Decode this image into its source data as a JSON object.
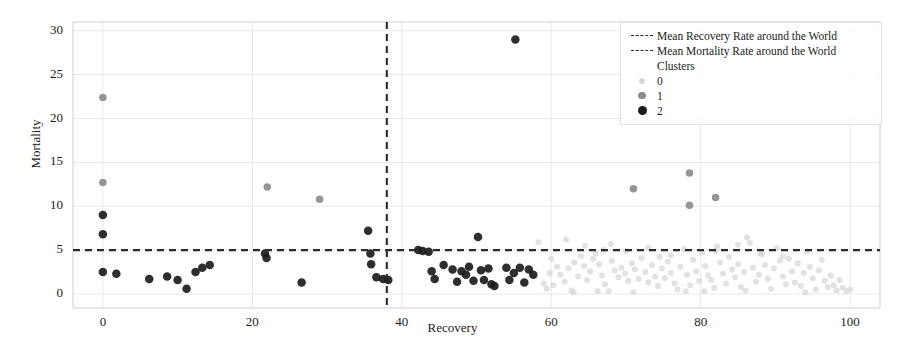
{
  "chart_data": {
    "type": "scatter",
    "title": "",
    "xlabel": "Recovery",
    "ylabel": "Mortality",
    "xlim": [
      -4,
      104
    ],
    "ylim": [
      -1.6,
      31
    ],
    "xticks": [
      0,
      20,
      40,
      60,
      80,
      100
    ],
    "yticks": [
      0,
      5,
      10,
      15,
      20,
      25,
      30
    ],
    "grid": true,
    "legend_position": "upper right",
    "reference_lines": [
      {
        "name": "Mean Recovery Rate around  the World",
        "orientation": "vertical",
        "value": 38.0,
        "style": "dashed",
        "color": "#2b2b2b"
      },
      {
        "name": "Mean Mortality Rate around  the World",
        "orientation": "horizontal",
        "value": 5.0,
        "style": "dashed",
        "color": "#2b2b2b"
      }
    ],
    "legend": {
      "line_entries": [
        "Mean Recovery Rate around  the World",
        "Mean Mortality Rate around  the World"
      ],
      "group_title": "Clusters",
      "cluster_entries": [
        "0",
        "1",
        "2"
      ]
    },
    "series": [
      {
        "name": "0",
        "cluster": 0,
        "color": "#d7d7d7",
        "marker_size": 6,
        "points": [
          [
            58.3,
            5.9
          ],
          [
            59.0,
            1.2
          ],
          [
            59.4,
            0.6
          ],
          [
            59.8,
            2.4
          ],
          [
            60.3,
            1.0
          ],
          [
            60.8,
            3.1
          ],
          [
            61.2,
            2.2
          ],
          [
            61.8,
            1.4
          ],
          [
            62.3,
            2.9
          ],
          [
            62.7,
            0.4
          ],
          [
            63.1,
            3.6
          ],
          [
            63.6,
            2.0
          ],
          [
            64.0,
            4.3
          ],
          [
            64.4,
            3.2
          ],
          [
            64.8,
            1.6
          ],
          [
            65.2,
            2.6
          ],
          [
            65.6,
            4.0
          ],
          [
            66.0,
            4.6
          ],
          [
            66.4,
            3.4
          ],
          [
            66.8,
            2.1
          ],
          [
            67.2,
            1.1
          ],
          [
            67.7,
            0.3
          ],
          [
            68.1,
            3.8
          ],
          [
            68.5,
            2.7
          ],
          [
            69.0,
            1.9
          ],
          [
            69.4,
            3.0
          ],
          [
            69.9,
            2.3
          ],
          [
            70.3,
            1.5
          ],
          [
            70.8,
            3.5
          ],
          [
            71.2,
            2.8
          ],
          [
            71.7,
            1.7
          ],
          [
            72.1,
            4.1
          ],
          [
            72.6,
            2.5
          ],
          [
            73.0,
            1.3
          ],
          [
            73.5,
            3.3
          ],
          [
            73.9,
            2.0
          ],
          [
            74.3,
            0.9
          ],
          [
            74.8,
            2.9
          ],
          [
            75.2,
            1.8
          ],
          [
            75.6,
            3.7
          ],
          [
            76.0,
            2.4
          ],
          [
            76.5,
            1.2
          ],
          [
            76.9,
            0.5
          ],
          [
            77.3,
            3.1
          ],
          [
            77.8,
            5.1
          ],
          [
            78.2,
            2.2
          ],
          [
            78.6,
            1.0
          ],
          [
            79.0,
            3.9
          ],
          [
            79.4,
            2.6
          ],
          [
            79.8,
            1.5
          ],
          [
            80.2,
            4.7
          ],
          [
            80.6,
            3.2
          ],
          [
            81.0,
            2.1
          ],
          [
            81.4,
            1.6
          ],
          [
            81.8,
            0.7
          ],
          [
            82.2,
            5.4
          ],
          [
            82.6,
            3.6
          ],
          [
            83.0,
            2.3
          ],
          [
            83.4,
            1.2
          ],
          [
            83.8,
            4.2
          ],
          [
            84.2,
            2.8
          ],
          [
            84.6,
            1.9
          ],
          [
            85.0,
            3.4
          ],
          [
            85.4,
            0.8
          ],
          [
            85.8,
            2.5
          ],
          [
            86.2,
            6.4
          ],
          [
            86.6,
            5.8
          ],
          [
            87.0,
            3.0
          ],
          [
            87.4,
            1.4
          ],
          [
            87.8,
            2.2
          ],
          [
            88.2,
            4.5
          ],
          [
            88.6,
            3.3
          ],
          [
            89.0,
            1.7
          ],
          [
            89.4,
            0.6
          ],
          [
            89.8,
            2.9
          ],
          [
            90.2,
            5.2
          ],
          [
            90.6,
            3.8
          ],
          [
            91.0,
            2.0
          ],
          [
            91.4,
            1.1
          ],
          [
            91.8,
            4.0
          ],
          [
            92.2,
            2.6
          ],
          [
            92.6,
            1.3
          ],
          [
            93.0,
            3.5
          ],
          [
            93.4,
            0.9
          ],
          [
            93.8,
            2.4
          ],
          [
            94.2,
            4.8
          ],
          [
            94.6,
            3.1
          ],
          [
            95.0,
            1.8
          ],
          [
            95.4,
            0.5
          ],
          [
            95.8,
            2.7
          ],
          [
            96.2,
            3.9
          ],
          [
            96.6,
            1.5
          ],
          [
            97.0,
            0.8
          ],
          [
            97.4,
            2.1
          ],
          [
            97.8,
            1.0
          ],
          [
            98.2,
            0.4
          ],
          [
            98.6,
            1.6
          ],
          [
            99.0,
            0.7
          ],
          [
            99.5,
            0.3
          ],
          [
            100.0,
            0.5
          ],
          [
            62.0,
            6.2
          ],
          [
            64.5,
            5.5
          ],
          [
            67.0,
            5.0
          ],
          [
            70.0,
            4.9
          ],
          [
            73.0,
            5.3
          ],
          [
            76.0,
            4.4
          ],
          [
            82.0,
            4.9
          ],
          [
            85.0,
            5.6
          ],
          [
            88.0,
            4.6
          ],
          [
            91.0,
            4.3
          ],
          [
            63.0,
            0.2
          ],
          [
            66.2,
            0.3
          ],
          [
            71.0,
            0.2
          ],
          [
            78.0,
            0.3
          ],
          [
            86.0,
            0.4
          ],
          [
            94.0,
            0.2
          ],
          [
            60.0,
            4.0
          ],
          [
            68.0,
            5.7
          ],
          [
            74.5,
            4.2
          ],
          [
            80.5,
            0.3
          ]
        ]
      },
      {
        "name": "1",
        "cluster": 1,
        "color": "#8c8c8c",
        "marker_size": 7.5,
        "points": [
          [
            0.0,
            22.4
          ],
          [
            0.0,
            12.7
          ],
          [
            22.0,
            12.2
          ],
          [
            29.0,
            10.8
          ],
          [
            71.0,
            12.0
          ],
          [
            78.5,
            13.8
          ],
          [
            78.5,
            10.1
          ],
          [
            82.0,
            11.0
          ]
        ]
      },
      {
        "name": "2",
        "cluster": 2,
        "color": "#1c1c1c",
        "marker_size": 8.5,
        "points": [
          [
            0.0,
            9.0
          ],
          [
            0.0,
            6.8
          ],
          [
            0.0,
            2.5
          ],
          [
            1.8,
            2.3
          ],
          [
            6.2,
            1.7
          ],
          [
            8.6,
            2.0
          ],
          [
            10.0,
            1.6
          ],
          [
            11.2,
            0.6
          ],
          [
            12.4,
            2.5
          ],
          [
            13.3,
            3.0
          ],
          [
            14.3,
            3.3
          ],
          [
            21.7,
            4.6
          ],
          [
            21.9,
            4.1
          ],
          [
            26.6,
            1.3
          ],
          [
            35.5,
            7.2
          ],
          [
            35.8,
            4.6
          ],
          [
            35.9,
            3.4
          ],
          [
            36.6,
            1.9
          ],
          [
            37.5,
            1.7
          ],
          [
            38.2,
            1.6
          ],
          [
            42.2,
            5.0
          ],
          [
            42.8,
            4.9
          ],
          [
            43.6,
            4.8
          ],
          [
            44.0,
            2.6
          ],
          [
            44.4,
            1.7
          ],
          [
            45.6,
            3.3
          ],
          [
            46.8,
            2.8
          ],
          [
            47.4,
            1.4
          ],
          [
            48.0,
            2.6
          ],
          [
            48.6,
            2.2
          ],
          [
            49.0,
            3.1
          ],
          [
            49.6,
            1.5
          ],
          [
            50.2,
            6.5
          ],
          [
            50.6,
            2.7
          ],
          [
            51.0,
            1.6
          ],
          [
            51.6,
            2.9
          ],
          [
            52.0,
            1.1
          ],
          [
            52.4,
            0.9
          ],
          [
            54.0,
            3.0
          ],
          [
            54.4,
            1.6
          ],
          [
            55.0,
            2.4
          ],
          [
            55.2,
            29.0
          ],
          [
            55.8,
            3.0
          ],
          [
            56.4,
            1.3
          ],
          [
            57.0,
            2.8
          ],
          [
            57.6,
            2.2
          ]
        ]
      }
    ]
  }
}
